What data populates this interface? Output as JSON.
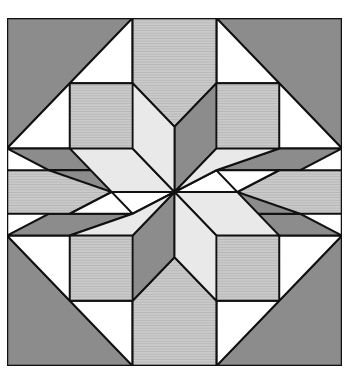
{
  "image": {
    "subject": "Quilt block: eight-pointed star with surrounding octagons",
    "grid_units": 8
  },
  "colors": {
    "dark": "#8c8c8c",
    "striped": "#c6c6c6",
    "stripe_line": "#a9a9a9",
    "pale": "#e9e9e9",
    "white": "#ffffff",
    "outline": "#111111"
  },
  "caption": "",
  "shapes": [
    {
      "fill": "dark",
      "pts": "0,0 3,0 0,3"
    },
    {
      "fill": "white",
      "pts": "3,0 3,1.5 1.5,1.5"
    },
    {
      "fill": "white",
      "pts": "0,3 1.5,1.5 1.5,3"
    },
    {
      "fill": "striped",
      "pts": "1.5,1.5 3,1.5 4,2.5 3,3.5 1.5,3.5 1.5,3"
    },
    {
      "fill": "dark",
      "pts": "3,0 4,1 4,2.5 3,1.5"
    },
    {
      "fill": "dark",
      "pts": "0,3 1.5,3 3,3.5 1,3.5"
    },
    {
      "fill": "dark",
      "pts": "8,0 5,0 8,3"
    },
    {
      "fill": "white",
      "pts": "5,0 5,1.5 6.5,1.5"
    },
    {
      "fill": "white",
      "pts": "8,3 6.5,1.5 6.5,3"
    },
    {
      "fill": "striped",
      "pts": "6.5,1.5 5,1.5 4,2.5 5,3.5 6.5,3.5 6.5,3"
    },
    {
      "fill": "dark",
      "pts": "5,0 4,1 4,2.5 5,1.5"
    },
    {
      "fill": "dark",
      "pts": "8,3 6.5,3 5,3.5 7,3.5"
    },
    {
      "fill": "dark",
      "pts": "0,8 3,8 0,5"
    },
    {
      "fill": "white",
      "pts": "3,8 3,6.5 1.5,6.5"
    },
    {
      "fill": "white",
      "pts": "0,5 1.5,6.5 1.5,5"
    },
    {
      "fill": "striped",
      "pts": "1.5,6.5 3,6.5 4,5.5 3,4.5 1.5,4.5 1.5,5"
    },
    {
      "fill": "dark",
      "pts": "3,8 4,7 4,5.5 3,6.5"
    },
    {
      "fill": "dark",
      "pts": "0,5 1.5,5 3,4.5 1,4.5"
    },
    {
      "fill": "dark",
      "pts": "8,8 5,8 8,5"
    },
    {
      "fill": "white",
      "pts": "5,8 5,6.5 6.5,6.5"
    },
    {
      "fill": "white",
      "pts": "8,5 6.5,6.5 6.5,5"
    },
    {
      "fill": "striped",
      "pts": "6.5,6.5 5,6.5 4,5.5 5,4.5 6.5,4.5 6.5,5"
    },
    {
      "fill": "dark",
      "pts": "5,8 4,7 4,5.5 5,6.5"
    },
    {
      "fill": "dark",
      "pts": "8,5 6.5,5 5,4.5 7,4.5"
    },
    {
      "fill": "striped",
      "pts": "3,0 5,0 5,1.5 4,2.5 3,1.5"
    },
    {
      "fill": "striped",
      "pts": "3,8 5,8 5,6.5 4,5.5 3,6.5"
    },
    {
      "fill": "striped",
      "pts": "0,3.5 1.5,3.5 2.5,4 1.5,4.5 0,4.5"
    },
    {
      "fill": "striped",
      "pts": "8,3.5 6.5,3.5 5.5,4 6.5,4.5 8,4.5"
    },
    {
      "fill": "white",
      "pts": "3,3.5 4,2.5 4,4"
    },
    {
      "fill": "white",
      "pts": "5,3.5 4,2.5 4,4"
    },
    {
      "fill": "white",
      "pts": "3,4.5 4,5.5 4,4"
    },
    {
      "fill": "white",
      "pts": "5,4.5 4,5.5 4,4"
    },
    {
      "fill": "white",
      "pts": "1.5,3.5 3,3.5 2.5,4"
    },
    {
      "fill": "white",
      "pts": "1.5,4.5 3,4.5 2.5,4"
    },
    {
      "fill": "white",
      "pts": "6.5,3.5 5,3.5 5.5,4"
    },
    {
      "fill": "white",
      "pts": "6.5,4.5 5,4.5 5.5,4"
    },
    {
      "fill": "dark",
      "pts": "4,4 4,2.5 5,1.5 5,3"
    },
    {
      "fill": "pale",
      "pts": "4,4 5,3 6.5,3 5,3.5"
    },
    {
      "fill": "dark",
      "pts": "4,4 5,4.5 7,4.5 5.5,4"
    },
    {
      "fill": "pale",
      "pts": "4,4 5.5,4 6.5,5 5,5"
    },
    {
      "fill": "dark",
      "pts": "4,4 4,5.5 3,6.5 3,5"
    },
    {
      "fill": "pale",
      "pts": "4,4 3,5 1.5,5 3,4.5"
    },
    {
      "fill": "dark",
      "pts": "4,4 3,3.5 1,3.5 2.5,4"
    },
    {
      "fill": "pale",
      "pts": "4,4 2.5,4 1.5,3 3,3"
    },
    {
      "fill": "pale",
      "pts": "4,4 3,3 3,1.5 4,2.5"
    },
    {
      "fill": "pale",
      "pts": "4,4 5,5 5,6.5 4,5.5"
    }
  ]
}
